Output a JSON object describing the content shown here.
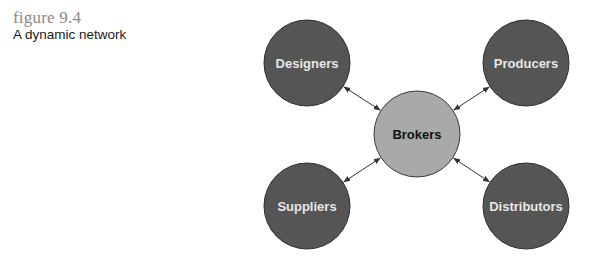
{
  "figure": {
    "number": "figure  9.4",
    "title": "A dynamic network"
  },
  "diagram": {
    "colors": {
      "outer_fill": "#555555",
      "outer_stroke": "#2e2e2e",
      "center_fill": "#a9a9a9",
      "center_stroke": "#3a3a3a",
      "outer_text": "#e6e6e6",
      "center_text": "#111111",
      "arrow": "#333333"
    },
    "center": {
      "id": "brokers",
      "label": "Brokers",
      "cx": 417,
      "cy": 134,
      "r": 43
    },
    "nodes": [
      {
        "id": "designers",
        "label": "Designers",
        "cx": 307,
        "cy": 63,
        "r": 43
      },
      {
        "id": "producers",
        "label": "Producers",
        "cx": 526,
        "cy": 63,
        "r": 43
      },
      {
        "id": "suppliers",
        "label": "Suppliers",
        "cx": 307,
        "cy": 206,
        "r": 43
      },
      {
        "id": "distributors",
        "label": "Distributors",
        "cx": 526,
        "cy": 206,
        "r": 43
      }
    ],
    "edges": [
      {
        "from": "designers",
        "to": "brokers",
        "direction": "bidirectional"
      },
      {
        "from": "producers",
        "to": "brokers",
        "direction": "bidirectional"
      },
      {
        "from": "suppliers",
        "to": "brokers",
        "direction": "bidirectional"
      },
      {
        "from": "distributors",
        "to": "brokers",
        "direction": "bidirectional"
      }
    ]
  }
}
